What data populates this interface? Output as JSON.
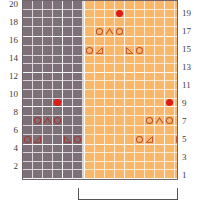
{
  "chart_data": {
    "type": "heatmap",
    "title": "",
    "xlabel": "",
    "ylabel": "",
    "rows": 20,
    "columns": 19,
    "row_numbering": "bottom-to-top, row 1 at bottom, row 20 at top",
    "left_axis_labels": [
      "20",
      "",
      "18",
      "",
      "16",
      "",
      "14",
      "",
      "12",
      "",
      "10",
      "",
      "8",
      "",
      "6",
      "",
      "4",
      "",
      "2",
      ""
    ],
    "right_axis_labels": [
      "",
      "19",
      "",
      "17",
      "",
      "15",
      "",
      "13",
      "",
      "11",
      "",
      "9",
      "",
      "7",
      "",
      "5",
      "",
      "3",
      "",
      "1"
    ],
    "left_axis_values": [
      20,
      18,
      16,
      14,
      12,
      10,
      8,
      6,
      4,
      2
    ],
    "right_axis_values": [
      19,
      17,
      15,
      13,
      11,
      9,
      7,
      5,
      3,
      1
    ],
    "background_regions": [
      {
        "name": "non-repeat-left",
        "color": "#7d7078",
        "columns": [
          1,
          2,
          3,
          4,
          5,
          6,
          7
        ]
      },
      {
        "name": "repeat-section",
        "color": "#f9b76a",
        "columns": [
          8,
          9,
          10,
          11,
          12,
          13,
          14,
          15,
          16,
          17,
          18,
          19
        ]
      }
    ],
    "grid": true,
    "grid_color": "#ffffff",
    "symbols": [
      {
        "name": "circle",
        "glyph": "O",
        "meaning": "yarn-over"
      },
      {
        "name": "chevron-up",
        "glyph": "∧",
        "meaning": "centered-double-decrease"
      },
      {
        "name": "triangle-right",
        "glyph": "◢",
        "meaning": "k2tog"
      },
      {
        "name": "triangle-left",
        "glyph": "◣",
        "meaning": "ssk"
      },
      {
        "name": "red-dot",
        "glyph": "●",
        "meaning": "marker",
        "color": "#e01b15"
      }
    ],
    "marks": [
      {
        "row": 19,
        "col": 11,
        "symbol": "red-dot"
      },
      {
        "row": 17,
        "col": 9,
        "symbol": "circle"
      },
      {
        "row": 17,
        "col": 10,
        "symbol": "chevron-up"
      },
      {
        "row": 17,
        "col": 11,
        "symbol": "circle"
      },
      {
        "row": 15,
        "col": 8,
        "symbol": "circle"
      },
      {
        "row": 15,
        "col": 9,
        "symbol": "triangle-right"
      },
      {
        "row": 15,
        "col": 12,
        "symbol": "triangle-left"
      },
      {
        "row": 15,
        "col": 13,
        "symbol": "circle"
      },
      {
        "row": 9,
        "col": 3,
        "symbol": "red-dot"
      },
      {
        "row": 9,
        "col": 16,
        "symbol": "red-dot"
      },
      {
        "row": 7,
        "col": 1,
        "symbol": "circle"
      },
      {
        "row": 7,
        "col": 2,
        "symbol": "chevron-up"
      },
      {
        "row": 7,
        "col": 3,
        "symbol": "circle"
      },
      {
        "row": 7,
        "col": 14,
        "symbol": "circle"
      },
      {
        "row": 7,
        "col": 15,
        "symbol": "chevron-up"
      },
      {
        "row": 7,
        "col": 16,
        "symbol": "circle"
      },
      {
        "row": 5,
        "col": 0,
        "symbol": "circle"
      },
      {
        "row": 5,
        "col": 1,
        "symbol": "triangle-right"
      },
      {
        "row": 5,
        "col": 4,
        "symbol": "triangle-left"
      },
      {
        "row": 5,
        "col": 5,
        "symbol": "circle"
      },
      {
        "row": 5,
        "col": 13,
        "symbol": "circle"
      },
      {
        "row": 5,
        "col": 14,
        "symbol": "triangle-right"
      },
      {
        "row": 5,
        "col": 17,
        "symbol": "triangle-left"
      },
      {
        "row": 5,
        "col": 18,
        "symbol": "circle"
      }
    ]
  },
  "legend": {
    "repeat_bracket_label": ""
  },
  "colors": {
    "gray_background": "#7d7078",
    "orange_background": "#f9b76a",
    "grid_line": "#ffffff",
    "symbol_on_gray": "#9e3b33",
    "symbol_on_orange": "#c2532c",
    "marker_red": "#e01b15",
    "border": "#6f646b"
  }
}
